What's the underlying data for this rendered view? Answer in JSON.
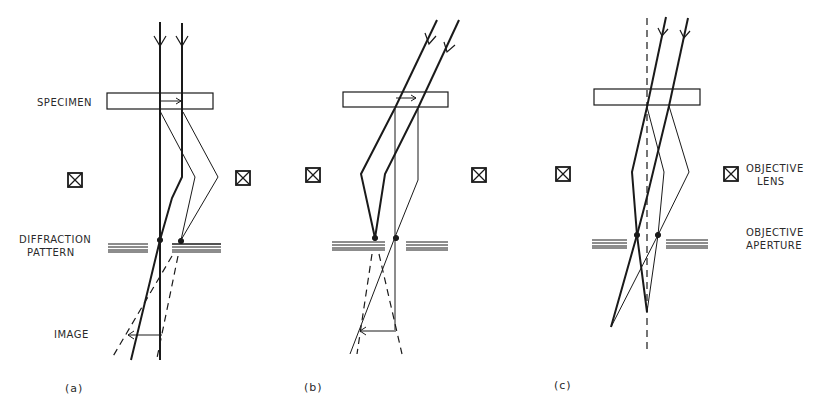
{
  "figure": {
    "labels": {
      "specimen": "SPECIMEN",
      "diffraction_pattern_line1": "DIFFRACTION",
      "diffraction_pattern_line2": "PATTERN",
      "image": "IMAGE",
      "objective_lens_line1": "OBJECTIVE",
      "objective_lens_line2": "LENS",
      "objective_aperture_line1": "OBJECTIVE",
      "objective_aperture_line2": "APERTURE"
    },
    "panels": [
      {
        "id": "a",
        "label": "(a)",
        "mode": "bright-field"
      },
      {
        "id": "b",
        "label": "(b)",
        "mode": "dark-field (displaced aperture)"
      },
      {
        "id": "c",
        "label": "(c)",
        "mode": "centered dark-field (tilted beam)"
      }
    ],
    "colors": {
      "line": "#1a1a1a",
      "thin_line": "#3a3a3a",
      "background": "#ffffff"
    }
  }
}
